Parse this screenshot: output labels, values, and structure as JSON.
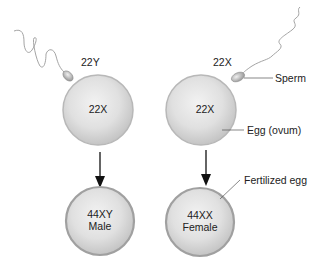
{
  "diagram": {
    "type": "sex-determination-fertilization",
    "colors": {
      "cell_fill": "#dcdcdc",
      "cell_edge": "#a8a8a8",
      "arrow": "#111111",
      "leader_line": "#555555",
      "text": "#222222"
    },
    "left": {
      "sperm_label": "22Y",
      "egg_label": "22X",
      "zygote_line1": "44XY",
      "zygote_line2": "Male"
    },
    "right": {
      "sperm_label": "22X",
      "egg_label": "22X",
      "zygote_line1": "44XX",
      "zygote_line2": "Female"
    },
    "callouts": {
      "sperm": "Sperm",
      "egg": "Egg (ovum)",
      "fertilized": "Fertilized egg"
    }
  }
}
